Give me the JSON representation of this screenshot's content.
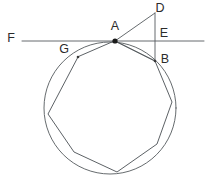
{
  "figure": {
    "width": 206,
    "height": 180,
    "background_color": "#ffffff",
    "stroke_color": "#555a5e",
    "label_color": "#2b2b2b",
    "vertex_dot_color": "#1a1a1a"
  },
  "labels": {
    "A": "A",
    "B": "B",
    "D": "D",
    "E": "E",
    "F": "F",
    "G": "G"
  },
  "geometry": {
    "circle": {
      "cx": 110,
      "cy": 108,
      "r": 66
    },
    "tangent_line": {
      "x1": 22,
      "y1": 41,
      "x2": 204,
      "y2": 41
    },
    "vertical_segment_DB": {
      "x1": 155,
      "y1": 13,
      "x2": 155,
      "y2": 61
    },
    "segment_AD": {
      "x1": 115,
      "y1": 41,
      "x2": 155,
      "y2": 13
    },
    "segment_AB": {
      "x1": 115,
      "y1": 41,
      "x2": 155,
      "y2": 61
    },
    "polygon_points": "115,41 155,61 172,102 157,144 117,172 74,152 48,114 78,57",
    "points": {
      "A": {
        "x": 115,
        "y": 41
      },
      "B": {
        "x": 155,
        "y": 61
      },
      "D": {
        "x": 155,
        "y": 13
      },
      "E": {
        "x": 155,
        "y": 41
      },
      "G": {
        "x": 78,
        "y": 57
      }
    },
    "label_positions": {
      "A": {
        "x": 115,
        "y": 27
      },
      "B": {
        "x": 165,
        "y": 60
      },
      "D": {
        "x": 160,
        "y": 9
      },
      "E": {
        "x": 164,
        "y": 34
      },
      "F": {
        "x": 11,
        "y": 39
      },
      "G": {
        "x": 64,
        "y": 50
      }
    }
  }
}
